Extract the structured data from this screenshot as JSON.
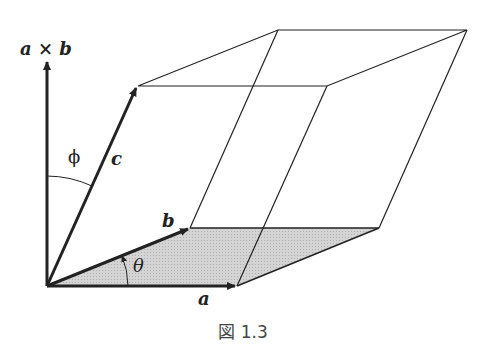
{
  "diagram": {
    "labels": {
      "axb": "a × b",
      "a": "a",
      "b": "b",
      "c": "c",
      "phi": "ϕ",
      "theta": "θ"
    },
    "caption": "図 1.3",
    "colors": {
      "stroke": "#222222",
      "shaded_base": "#c8c8c8"
    }
  }
}
